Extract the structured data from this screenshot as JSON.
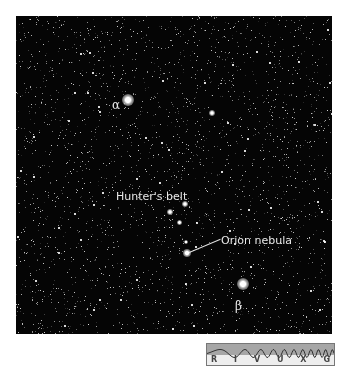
{
  "figure": {
    "labels": {
      "alpha": "α",
      "beta": "β",
      "belt": "Hunter's belt",
      "nebula": "Orion nebula"
    },
    "wavelength_strip": {
      "bands": [
        "R",
        "I",
        "V",
        "U",
        "X",
        "G"
      ],
      "highlighted": "V"
    },
    "colors": {
      "sky": "#050505",
      "label": "#e8e8e8",
      "strip_wave_bg": "#a6a6a6",
      "strip_label_bg": "#eeeeee"
    }
  }
}
